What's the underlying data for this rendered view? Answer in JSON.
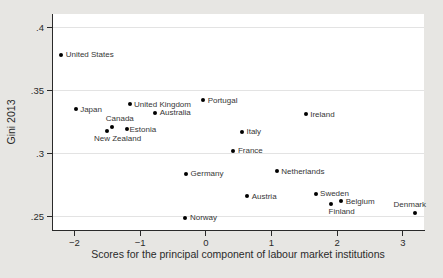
{
  "figure": {
    "background": "#e7e6e3",
    "plot_background": "#ffffff",
    "grid_color": "#e3e3e3",
    "axis_color": "#2a2a2a",
    "marker_color": "#000000",
    "label_color": "#363636"
  },
  "chart_data": {
    "type": "scatter",
    "title": "",
    "xlabel": "Scores for the principal component of labour market institutions",
    "ylabel": "Gini 2013",
    "xlim": [
      -2.34,
      3.32
    ],
    "ylim": [
      0.2393,
      0.4103
    ],
    "grid": "horizontal",
    "legend": "none",
    "x_ticks": [
      {
        "value": -2,
        "label": "−2"
      },
      {
        "value": -1,
        "label": "−1"
      },
      {
        "value": 0,
        "label": "0"
      },
      {
        "value": 1,
        "label": "1"
      },
      {
        "value": 2,
        "label": "2"
      },
      {
        "value": 3,
        "label": "3"
      }
    ],
    "y_ticks": [
      {
        "value": 0.25,
        "label": ".25"
      },
      {
        "value": 0.3,
        "label": ".3"
      },
      {
        "value": 0.35,
        "label": ".35"
      },
      {
        "value": 0.4,
        "label": ".4"
      }
    ],
    "points": [
      {
        "country": "United States",
        "x": -2.2,
        "y": 0.378,
        "label_pos": "right",
        "label_dx": 0
      },
      {
        "country": "Portugal",
        "x": -0.04,
        "y": 0.342,
        "label_pos": "right",
        "label_dx": 0
      },
      {
        "country": "United Kingdom",
        "x": -1.16,
        "y": 0.339,
        "label_pos": "right",
        "label_dx": 0
      },
      {
        "country": "Japan",
        "x": -1.98,
        "y": 0.335,
        "label_pos": "right",
        "label_dx": 0
      },
      {
        "country": "Australia",
        "x": -0.77,
        "y": 0.332,
        "label_pos": "right",
        "label_dx": 0
      },
      {
        "country": "Ireland",
        "x": 1.52,
        "y": 0.331,
        "label_pos": "right",
        "label_dx": 0
      },
      {
        "country": "Canada",
        "x": -1.43,
        "y": 0.321,
        "label_pos": "above",
        "label_dx": 8
      },
      {
        "country": "Estonia",
        "x": -1.2,
        "y": 0.319,
        "label_pos": "right",
        "label_dx": -2
      },
      {
        "country": "New Zealand",
        "x": -1.51,
        "y": 0.318,
        "label_pos": "below",
        "label_dx": 11
      },
      {
        "country": "Italy",
        "x": 0.55,
        "y": 0.317,
        "label_pos": "right",
        "label_dx": 0
      },
      {
        "country": "France",
        "x": 0.42,
        "y": 0.302,
        "label_pos": "right",
        "label_dx": 0
      },
      {
        "country": "Netherlands",
        "x": 1.08,
        "y": 0.286,
        "label_pos": "right",
        "label_dx": 0
      },
      {
        "country": "Germany",
        "x": -0.3,
        "y": 0.284,
        "label_pos": "right",
        "label_dx": 0
      },
      {
        "country": "Sweden",
        "x": 1.67,
        "y": 0.268,
        "label_pos": "right",
        "label_dx": 0
      },
      {
        "country": "Austria",
        "x": 0.63,
        "y": 0.266,
        "label_pos": "right",
        "label_dx": 0
      },
      {
        "country": "Belgium",
        "x": 2.06,
        "y": 0.262,
        "label_pos": "right",
        "label_dx": 0
      },
      {
        "country": "Finland",
        "x": 1.9,
        "y": 0.26,
        "label_pos": "below",
        "label_dx": 11
      },
      {
        "country": "Denmark",
        "x": 3.18,
        "y": 0.253,
        "label_pos": "above",
        "label_dx": -5
      },
      {
        "country": "Norway",
        "x": -0.31,
        "y": 0.249,
        "label_pos": "right",
        "label_dx": 0
      }
    ]
  }
}
